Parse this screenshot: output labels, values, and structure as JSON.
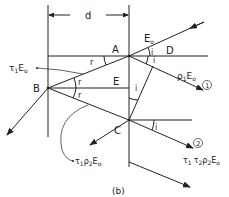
{
  "figure": {
    "caption": "(b)",
    "dimension_label": "d",
    "points": {
      "A": "A",
      "B": "B",
      "C": "C",
      "D": "D",
      "E": "E"
    },
    "angles": {
      "i": "i",
      "r": "r"
    },
    "rays": {
      "incident": {
        "symbol": "E",
        "sub": "o"
      },
      "reflected_1": {
        "prefix": "ρ",
        "prefix_sub": "1",
        "symbol": "E",
        "sub": "o",
        "marker": "1"
      },
      "transmitted_1": {
        "prefix": "τ",
        "prefix_sub": "1",
        "symbol": "E",
        "sub": "o"
      },
      "internal_reflected": {
        "p1": "τ",
        "p1_sub": "1",
        "p2": "ρ",
        "p2_sub": "2",
        "symbol": "E",
        "sub": "o"
      },
      "reflected_2": {
        "p1": "τ",
        "p1_sub": "1",
        "p2": "τ",
        "p2_sub": "2",
        "p3": "ρ",
        "p3_sub": "2",
        "symbol": "E",
        "sub": "o",
        "marker": "2"
      }
    }
  }
}
